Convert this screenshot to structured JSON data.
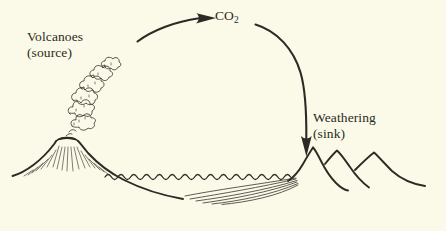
{
  "figure": {
    "background_color": "#fbfae8",
    "ink_color": "#2b2a24",
    "width": 446,
    "height": 231
  },
  "labels": {
    "volcanoes": "Volcanoes\n(source)",
    "volcanoes_line1": "Volcanoes",
    "volcanoes_line2": "(source)",
    "weathering_line1": "Weathering",
    "weathering_line2": "(sink)",
    "co2_text": "CO",
    "co2_subscript": "2"
  },
  "elements": {
    "arrow_left": "arrow pointing right toward CO2 label",
    "arrow_right": "arrow curving right and down toward mountains",
    "volcano": "erupting volcano with smoke plume on left",
    "ocean": "wavy sea surface line",
    "sediment": "sediment strata layers on sea floor",
    "mountains": "three overlapping mountain peaks on right"
  }
}
